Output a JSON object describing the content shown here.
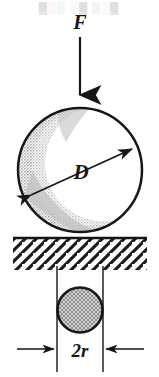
{
  "figure": {
    "type": "mechanical-engineering-diagram",
    "background_color": "#ffffff",
    "line_color": "#161616",
    "labels": {
      "force": "F",
      "diameter": "D",
      "contact_diameter": "2r"
    },
    "scan_artifact": {
      "visible": true,
      "text": "▓░▒ ░▓ ▒░▓",
      "color": "#d9d9d9"
    },
    "elements": {
      "force_arrow": {
        "name": "force-arrow",
        "label": "F",
        "direction": "down",
        "x": 80,
        "y_start": 36,
        "y_end": 104,
        "label_x": 80,
        "label_y": 28
      },
      "sphere": {
        "name": "large-sphere",
        "label": "D",
        "center_x": 80,
        "center_y": 170,
        "radius": 63,
        "shading": "stipple-crescent-left",
        "shade_color": "#d5d5d5",
        "outline_width": 2.4
      },
      "diameter_arrow": {
        "name": "diameter-dimension-arrow",
        "label": "D",
        "x1": 29,
        "y1": 197,
        "x2": 134,
        "y2": 148,
        "double_headed": true,
        "label_x": 81,
        "label_y": 178
      },
      "ground": {
        "name": "ground-surface",
        "line_y": 237,
        "line_x_start": 13,
        "line_x_end": 147,
        "hatch_angle_deg": 45,
        "hatch_depth": 32,
        "hatch_color": "#161616"
      },
      "contact_circle": {
        "name": "contact-area-circle",
        "center_x": 80,
        "center_y": 310,
        "radius": 23,
        "texture": "cross-hatch",
        "texture_color": "#9d9d9d",
        "outline_width": 2.4
      },
      "contact_dimension": {
        "name": "contact-diameter-dimension",
        "label": "2r",
        "extension_x_left": 57,
        "extension_x_right": 103,
        "extension_y_top": 266,
        "extension_y_bottom": 372,
        "dimension_line_y": 349,
        "arrow_left_start_x": 16,
        "arrow_right_start_x": 145,
        "label_x": 80,
        "label_y": 356
      }
    }
  }
}
